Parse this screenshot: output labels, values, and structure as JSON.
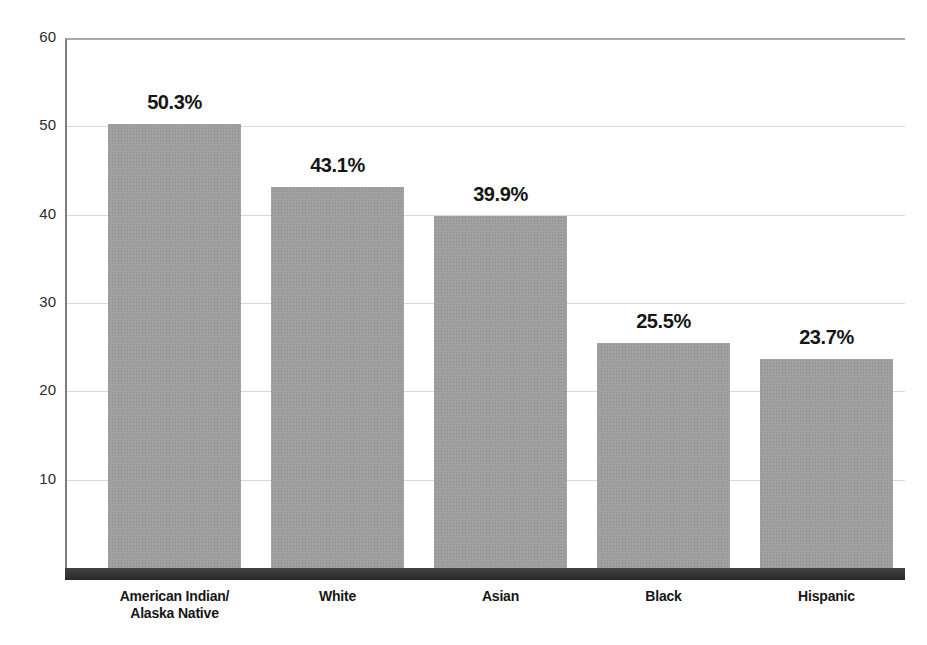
{
  "chart_data": {
    "type": "bar",
    "categories": [
      "American Indian/\nAlaska Native",
      "White",
      "Asian",
      "Black",
      "Hispanic"
    ],
    "values": [
      50.3,
      43.1,
      39.9,
      25.5,
      23.7
    ],
    "bar_labels": [
      "50.3%",
      "43.1%",
      "39.9%",
      "25.5%",
      "23.7%"
    ],
    "title": "",
    "xlabel": "",
    "ylabel": "",
    "ylim": [
      0,
      60
    ],
    "yticks": [
      10,
      20,
      30,
      40,
      50,
      60
    ],
    "grid": true,
    "legend": false,
    "colors": {
      "bar_fill": "#9c9c9c",
      "baseline_band": "#323232",
      "gridline": "#d8d8d8",
      "axis_line": "#7d7d7d",
      "plot_top_border": "#ababab",
      "text": "#161616",
      "background": "#ffffff"
    }
  }
}
